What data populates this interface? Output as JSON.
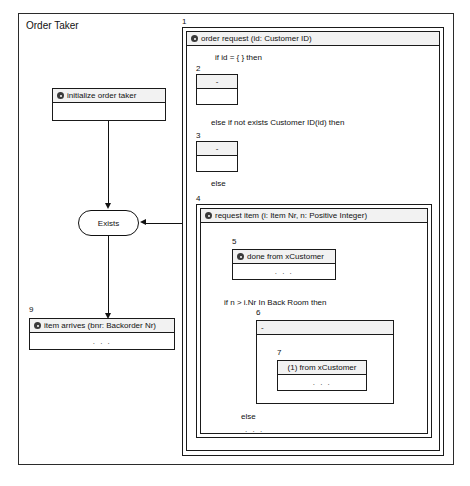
{
  "diagram": {
    "title": "Order Taker",
    "marker_icon": "at-marker-icon",
    "ellipsis": ". . ."
  },
  "left_panel": {
    "init_box": {
      "number": "",
      "header": "initialize order taker",
      "body": ""
    },
    "state": {
      "label": "Exists"
    },
    "item_arrives_box": {
      "number": "9",
      "header": "item arrives (bnr: Backorder Nr)",
      "body": ". . ."
    }
  },
  "right_panel": {
    "order_request": {
      "number": "1",
      "header": "order request (id: Customer ID)",
      "cond_if": "if id = { } then",
      "branch_empty_1": {
        "number": "2",
        "header": "-",
        "body": ""
      },
      "cond_elseif": "else if not exists Customer ID(id) then",
      "branch_empty_2": {
        "number": "3",
        "header": "-",
        "body": ""
      },
      "cond_else": "else"
    },
    "request_item": {
      "number": "4",
      "header": "request item (i: Item Nr, n: Positive Integer)",
      "done_box": {
        "number": "5",
        "header": "done from xCustomer",
        "body": ". . ."
      },
      "cond_if": "if n > i.Nr In Back Room then",
      "outer_nested": {
        "number": "6",
        "header": "-"
      },
      "inner_nested": {
        "number": "7",
        "header": "(1) from xCustomer",
        "body": ". . ."
      },
      "cond_else": "else",
      "else_body": ". . ."
    }
  }
}
